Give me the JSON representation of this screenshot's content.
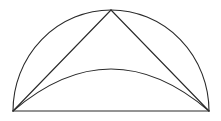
{
  "diagram": {
    "type": "geometric-figure",
    "stroke_color": "#2a2a2a",
    "background": "#ffffff",
    "points": {
      "left": [
        13,
        111
      ],
      "right": [
        209,
        111
      ],
      "apex": [
        111,
        10
      ],
      "inner_arc_peak": [
        111,
        69
      ]
    },
    "labels": []
  }
}
